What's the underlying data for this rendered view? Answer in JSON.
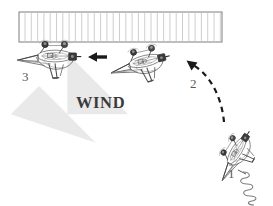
{
  "figure": {
    "background_color": "#ffffff",
    "width": 273,
    "height": 206
  },
  "wind": {
    "label": "WIND",
    "label_color": "#3b3b3b",
    "arrow_color": "#e8e8e8",
    "arrow_direction": "up-left",
    "label_x": 76,
    "label_y": 95
  },
  "barrier": {
    "name": "recovery-net",
    "description": "vertical-barred capture net",
    "x": 19,
    "y": 12,
    "width": 203,
    "height": 30,
    "bar_count": 32,
    "frame_color": "#6e6e6e",
    "bar_color": "#c9c9c9"
  },
  "stages": [
    {
      "id": 1,
      "label": "1",
      "name": "uav-stage-1-launch",
      "label_x": 228,
      "label_y": 174,
      "cx": 236,
      "cy": 150,
      "rotation_deg": -58,
      "scale": 0.92,
      "state": "launching off spring catapult"
    },
    {
      "id": 2,
      "label": "2",
      "name": "uav-stage-2-climb",
      "label_x": 190,
      "label_y": 83,
      "cx": 145,
      "cy": 60,
      "rotation_deg": -13,
      "scale": 1.0,
      "state": "transitioning toward net"
    },
    {
      "id": 3,
      "label": "3",
      "name": "uav-stage-3-capture",
      "label_x": 22,
      "label_y": 77,
      "cx": 55,
      "cy": 55,
      "rotation_deg": 0,
      "scale": 1.05,
      "state": "captured at net"
    }
  ],
  "arrows": [
    {
      "name": "approach-arrow-solid",
      "style": "solid",
      "color": "#1a1a1a",
      "from_x": 107,
      "from_y": 57,
      "to_x": 88,
      "to_y": 57,
      "direction": "left"
    },
    {
      "name": "trajectory-arrow-dashed",
      "style": "dashed",
      "color": "#1a1a1a",
      "from_x": 224,
      "from_y": 122,
      "to_x": 187,
      "to_y": 60,
      "direction": "up-left curved"
    }
  ],
  "launcher": {
    "name": "spring-catapult",
    "coil_turns": 6,
    "color": "#7a7a7a",
    "x": 240,
    "y": 172
  },
  "label_color": "#5a5a5a"
}
